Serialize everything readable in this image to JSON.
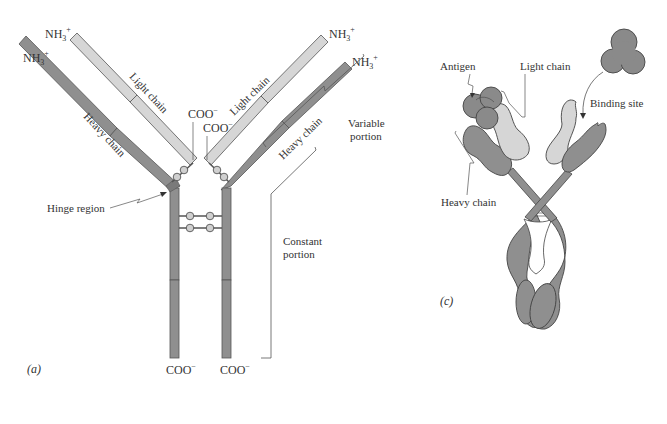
{
  "colors": {
    "heavy_chain": "#8f8f8f",
    "light_chain": "#d6d6d6",
    "outline": "#555555",
    "text": "#333333",
    "antigen": "#8a8a8a"
  },
  "panel_a": {
    "label": "(a)",
    "termini": {
      "nh3_left_light": "NH3",
      "nh3_left_heavy": "NH3",
      "nh3_right_light": "NH3",
      "nh3_right_heavy": "NH3",
      "superscript_plus": "+",
      "subscript_3": "3",
      "nh_prefix": "NH",
      "coo_left_light": "COO",
      "coo_right_light": "COO",
      "coo_left_heavy": "COO",
      "coo_right_heavy": "COO",
      "superscript_minus": "−"
    },
    "labels": {
      "light_chain_left": "Light chain",
      "light_chain_right": "Light chain",
      "heavy_chain_left": "Heavy chain",
      "heavy_chain_right": "Heavy chain",
      "hinge_region": "Hinge region",
      "variable_portion_line1": "Variable",
      "variable_portion_line2": "portion",
      "constant_portion_line1": "Constant",
      "constant_portion_line2": "portion",
      "disulfide_atom": "S"
    }
  },
  "panel_c": {
    "label": "(c)",
    "labels": {
      "antigen": "Antigen",
      "light_chain": "Light chain",
      "binding_site": "Binding site",
      "heavy_chain": "Heavy chain"
    }
  }
}
